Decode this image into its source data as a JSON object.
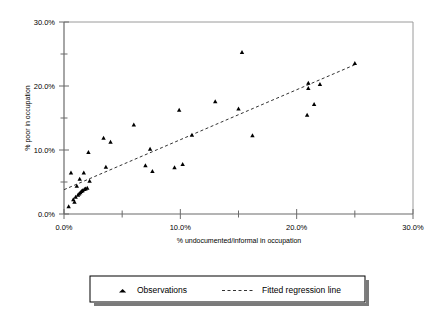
{
  "chart_data": {
    "type": "scatter",
    "title": "",
    "xlabel": "% undocumented/informal in occupation",
    "ylabel": "% poor in occupation",
    "xlim": [
      0,
      30
    ],
    "ylim": [
      0,
      30
    ],
    "grid": false,
    "xticks": [
      0,
      5,
      10,
      15,
      20,
      25,
      30
    ],
    "yticks": [
      0,
      5,
      10,
      15,
      20,
      25,
      30
    ],
    "xtick_labels": [
      "0.0%",
      "",
      "10.0%",
      "",
      "20.0%",
      "",
      "30.0%"
    ],
    "ytick_labels": [
      "0.0%",
      "",
      "10.0%",
      "",
      "20.0%",
      "",
      "30.0%"
    ],
    "legend_position": "bottom",
    "series": [
      {
        "name": "Observations",
        "marker": "triangle",
        "color": "#000000",
        "points": [
          [
            0.4,
            1.2
          ],
          [
            0.6,
            6.5
          ],
          [
            0.8,
            2.3
          ],
          [
            0.9,
            1.9
          ],
          [
            1.0,
            2.7
          ],
          [
            1.1,
            4.4
          ],
          [
            1.2,
            3.0
          ],
          [
            1.3,
            3.2
          ],
          [
            1.35,
            5.5
          ],
          [
            1.4,
            3.4
          ],
          [
            1.5,
            3.6
          ],
          [
            1.6,
            3.7
          ],
          [
            1.7,
            6.5
          ],
          [
            1.75,
            3.9
          ],
          [
            1.85,
            4.0
          ],
          [
            2.0,
            4.1
          ],
          [
            2.1,
            9.7
          ],
          [
            2.2,
            5.2
          ],
          [
            3.4,
            11.9
          ],
          [
            3.6,
            7.4
          ],
          [
            4.0,
            11.3
          ],
          [
            6.0,
            14.0
          ],
          [
            7.0,
            7.6
          ],
          [
            7.4,
            10.2
          ],
          [
            7.6,
            6.7
          ],
          [
            9.5,
            7.3
          ],
          [
            9.9,
            16.3
          ],
          [
            10.2,
            7.8
          ],
          [
            11.0,
            12.4
          ],
          [
            13.0,
            17.6
          ],
          [
            15.0,
            16.5
          ],
          [
            15.3,
            25.3
          ],
          [
            16.2,
            12.3
          ],
          [
            20.9,
            15.5
          ],
          [
            21.0,
            20.5
          ],
          [
            21.0,
            19.7
          ],
          [
            21.5,
            17.2
          ],
          [
            22.0,
            20.3
          ],
          [
            25.0,
            23.6
          ]
        ]
      }
    ],
    "fit_line": {
      "name": "Fitted regression line",
      "style": "dashed",
      "color": "#333333",
      "x_start": 0.0,
      "y_start": 3.8,
      "x_end": 25.1,
      "y_end": 23.4
    },
    "legend_entries": [
      {
        "label": "Observations",
        "marker": "triangle"
      },
      {
        "label": "Fitted regression line",
        "marker": "dashed-line"
      }
    ]
  }
}
